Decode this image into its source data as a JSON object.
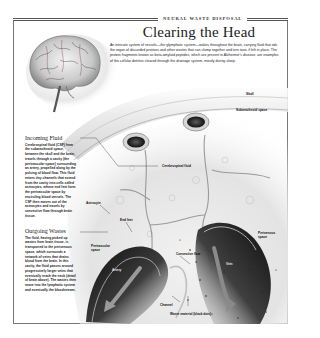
{
  "header": {
    "kicker": "NEURAL WASTE DISPOSAL",
    "title": "Clearing the Head",
    "intro": "An intricate system of vessels—the glymphatic system—wakes throughout the brain, carrying fluid that rids the organ of discarded proteins and other wastes that can clump together and turn toxic if left in place. The protein fragments known as beta-amyloid peptides, which are present in Alzheimer's disease, are examples of the cellular detritus cleared through the drainage system, mostly during sleep."
  },
  "sidebar": {
    "incoming": {
      "heading": "Incoming Fluid",
      "body": "Cerebrospinal fluid (CSF) from the subarachnoid space, between the skull and the brain, travels through a cavity (the perivascular space) surrounding an artery, propelled along by the pulsing of blood flow. This fluid enters tiny channels that extend from the cavity into cells called astrocytes, whose end feet form the perivascular space by encircling blood vessels. The CSF then moves out of the astrocytes and travels by convective flow through brain tissue."
    },
    "outgoing": {
      "heading": "Outgoing Wastes",
      "body": "The fluid, having picked up wastes from brain tissue, is transported to the perivenous space, which surrounds a network of veins that drains blood from the brain. In this cavity, the fluid passes around progressively larger veins that eventually reach the neck (detail of brain above). The wastes then move into the lymphatic system and eventually the bloodstream."
    }
  },
  "labels": {
    "skull": "Skull",
    "subarachnoid": "Subarachnoid space",
    "csf": "Cerebrospinal fluid",
    "astrocyte": "Astrocyte",
    "end_feet": "End feet",
    "perivascular": "Perivascular space",
    "convective": "Convective flow",
    "perivenous": "Perivenous space",
    "artery": "Artery",
    "vein": "Vein",
    "channel": "Channel",
    "waste": "Waste material (black dots)"
  },
  "colors": {
    "ink": "#111111",
    "frame": "#777777",
    "tissue_light": "#ececec",
    "vessel_dark": "#1e1e1e"
  }
}
